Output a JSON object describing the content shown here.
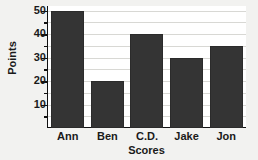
{
  "chart_data": {
    "type": "bar",
    "title": "",
    "categories": [
      "Ann",
      "Ben",
      "C.D.",
      "Jake",
      "Jon"
    ],
    "values": [
      50,
      20,
      40,
      30,
      35
    ],
    "xlabel": "Scores",
    "ylabel": "Points",
    "ylim": [
      0,
      52
    ],
    "yticks": [
      10,
      20,
      30,
      40,
      50
    ],
    "ytick_labels": [
      "10",
      "20",
      "30",
      "40",
      "50"
    ],
    "yminor_ticks": [
      5,
      15,
      25,
      35,
      45
    ],
    "gridlines": [
      5,
      10,
      15,
      20,
      25,
      30,
      35,
      40,
      45,
      50
    ],
    "grid": true,
    "legend": null,
    "bar_color": "#343434",
    "background_color": "#f2f2f0",
    "plot_background_color": "#ffffff",
    "axis_color": "#111111",
    "grid_color": "#d8d8d4"
  }
}
